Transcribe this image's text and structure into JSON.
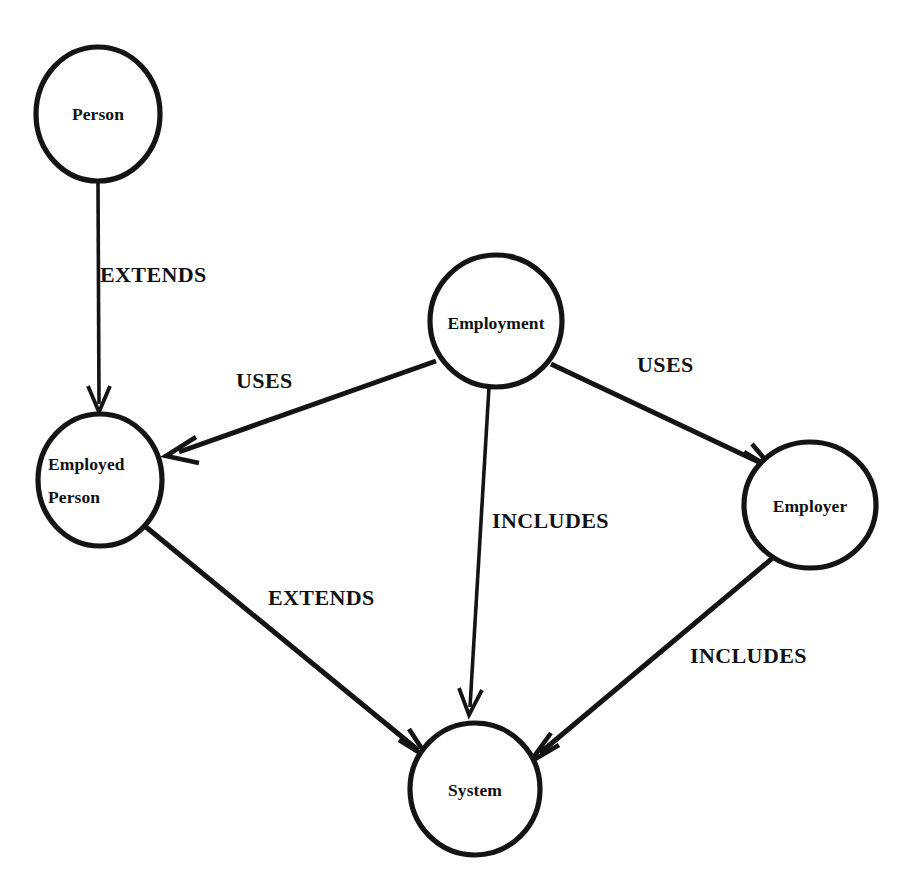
{
  "diagram": {
    "background_color": "#ffffff",
    "stroke_color": "#141414",
    "nodes": [
      {
        "id": "person",
        "label": "Person",
        "label_lines": [
          "Person"
        ],
        "cx": 98,
        "cy": 114,
        "rx": 62,
        "ry": 67
      },
      {
        "id": "employed_person",
        "label": "Employed Person",
        "label_lines": [
          "Employed",
          "Person"
        ],
        "cx": 100,
        "cy": 480,
        "rx": 62,
        "ry": 66
      },
      {
        "id": "employment",
        "label": "Employment",
        "label_lines": [
          "Employment"
        ],
        "cx": 496,
        "cy": 321,
        "rx": 66,
        "ry": 66
      },
      {
        "id": "employer",
        "label": "Employer",
        "label_lines": [
          "Employer"
        ],
        "cx": 810,
        "cy": 505,
        "rx": 66,
        "ry": 63
      },
      {
        "id": "system",
        "label": "System",
        "label_lines": [
          "System"
        ],
        "cx": 475,
        "cy": 789,
        "rx": 65,
        "ry": 66
      }
    ],
    "edges": [
      {
        "id": "e1",
        "from": "person",
        "to": "employed_person",
        "label": "EXTENDS",
        "label_x": 100,
        "label_y": 282,
        "label_anchor": "start"
      },
      {
        "id": "e2",
        "from": "employment",
        "to": "employed_person",
        "label": "USES",
        "label_x": 236,
        "label_y": 388,
        "label_anchor": "start"
      },
      {
        "id": "e3",
        "from": "employment",
        "to": "employer",
        "label": "USES",
        "label_x": 637,
        "label_y": 372,
        "label_anchor": "start"
      },
      {
        "id": "e4",
        "from": "employment",
        "to": "system",
        "label": "INCLUDES",
        "label_x": 492,
        "label_y": 528,
        "label_anchor": "start"
      },
      {
        "id": "e5",
        "from": "employed_person",
        "to": "system",
        "label": "EXTENDS",
        "label_x": 268,
        "label_y": 605,
        "label_anchor": "start"
      },
      {
        "id": "e6",
        "from": "employer",
        "to": "system",
        "label": "INCLUDES",
        "label_x": 690,
        "label_y": 663,
        "label_anchor": "start"
      }
    ]
  }
}
